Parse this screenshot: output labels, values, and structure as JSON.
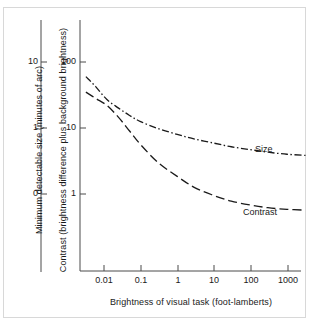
{
  "chart_data": {
    "type": "line",
    "title": "",
    "xlabel": "Brightness of visual task (foot-lamberts)",
    "ylabel_left": "Minimum detectable size (minutes of arc)",
    "ylabel_main": "Contrast (brightness difference plus background brightness)",
    "xscale": "log",
    "yscale": "log",
    "xlim": [
      0.0032,
      3200
    ],
    "xticks": [
      "0.01",
      "0.1",
      "1",
      "10",
      "100",
      "1000"
    ],
    "xtick_values": [
      0.01,
      0.1,
      1,
      10,
      100,
      1000
    ],
    "yticks_left": [
      "10",
      "1",
      "0"
    ],
    "ytick_left_values": [
      10,
      1,
      0
    ],
    "yticks_main": [
      "100",
      "10",
      "1"
    ],
    "ytick_main_values": [
      100,
      10,
      1
    ],
    "grid": false,
    "legend_position": "inline-right",
    "series": [
      {
        "name": "Size",
        "style": "dash-dot",
        "label_x": 1000,
        "label_y": 4.0,
        "x": [
          0.0032,
          0.006,
          0.012,
          0.025,
          0.05,
          0.1,
          0.3,
          1,
          3,
          10,
          30,
          100,
          300,
          1000,
          3200
        ],
        "y": [
          60,
          42,
          27,
          20,
          15.5,
          12.5,
          9.8,
          8.0,
          6.8,
          5.9,
          5.2,
          4.7,
          4.3,
          4.0,
          3.85
        ]
      },
      {
        "name": "Contrast",
        "style": "long-dash",
        "label_x": 1000,
        "label_y": 0.85,
        "x": [
          0.0032,
          0.006,
          0.012,
          0.025,
          0.05,
          0.1,
          0.3,
          1,
          3,
          10,
          30,
          100,
          300,
          1000,
          3200
        ],
        "y": [
          35,
          28,
          22,
          14.5,
          9.0,
          5.6,
          3.0,
          1.85,
          1.25,
          0.95,
          0.78,
          0.68,
          0.62,
          0.585,
          0.57
        ]
      }
    ]
  },
  "axes": {
    "left_axis_name": "minimum-detectable-size-axis",
    "main_axis_name": "contrast-axis",
    "x_axis_name": "brightness-axis"
  }
}
